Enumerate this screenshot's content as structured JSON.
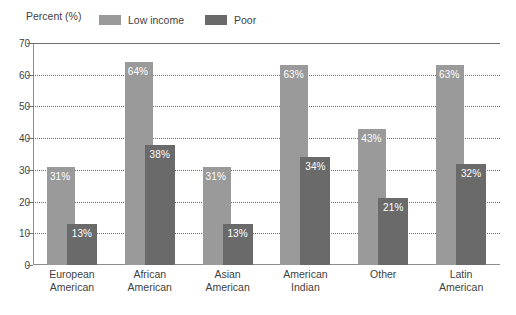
{
  "axis_title": "Percent (%)",
  "legend": [
    {
      "key": "low",
      "label": "Low income",
      "color": "#9a9a9a"
    },
    {
      "key": "poor",
      "label": "Poor",
      "color": "#6a6a6a"
    }
  ],
  "y_ticks": [
    "70",
    "60",
    "50",
    "40",
    "30",
    "20",
    "10",
    "0"
  ],
  "chart_data": {
    "type": "bar",
    "title": "",
    "subtitle": "",
    "xlabel": "",
    "ylabel": "Percent (%)",
    "ylim": [
      0,
      70
    ],
    "ytick_step": 10,
    "grid": true,
    "grid_style": "dotted",
    "legend_position": "top",
    "categories": [
      "European American",
      "African American",
      "Asian American",
      "American Indian",
      "Other",
      "Latin American"
    ],
    "category_lines": [
      [
        "European",
        "American"
      ],
      [
        "African",
        "American"
      ],
      [
        "Asian",
        "American"
      ],
      [
        "American",
        "Indian"
      ],
      [
        "Other",
        ""
      ],
      [
        "Latin",
        "American"
      ]
    ],
    "series": [
      {
        "name": "Low income",
        "color": "#9a9a9a",
        "values": [
          31,
          64,
          31,
          63,
          43,
          63
        ],
        "labels": [
          "31%",
          "64%",
          "31%",
          "63%",
          "43%",
          "63%"
        ]
      },
      {
        "name": "Poor",
        "color": "#6a6a6a",
        "values": [
          13,
          38,
          13,
          34,
          21,
          32
        ],
        "labels": [
          "13%",
          "38%",
          "13%",
          "34%",
          "21%",
          "32%"
        ]
      }
    ]
  }
}
